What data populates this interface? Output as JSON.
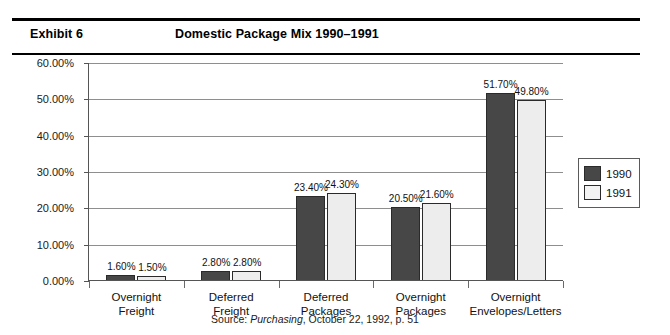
{
  "header": {
    "exhibit_label": "Exhibit 6",
    "title": "Domestic Package Mix 1990–1991"
  },
  "source": {
    "prefix": "Source: ",
    "publication": "Purchasing",
    "suffix": ", October 22, 1992, p. 51"
  },
  "legend": {
    "items": [
      {
        "label": "1990",
        "color": "#474747"
      },
      {
        "label": "1991",
        "color": "#f2f2f2"
      }
    ]
  },
  "chart_data": {
    "type": "bar",
    "title": "Domestic Package Mix 1990–1991",
    "xlabel": "",
    "ylabel": "",
    "ylim": [
      0,
      60
    ],
    "yticks": [
      0,
      10,
      20,
      30,
      40,
      50,
      60
    ],
    "ytick_labels": [
      "0.00%",
      "10.00%",
      "20.00%",
      "30.00%",
      "40.00%",
      "50.00%",
      "60.00%"
    ],
    "grid": true,
    "legend_position": "right",
    "categories": [
      "Overnight\nFreight",
      "Deferred\nFreight",
      "Deferred\nPackages",
      "Overnight\nPackages",
      "Overnight\nEnvelopes/Letters"
    ],
    "category_lines": [
      [
        "Overnight",
        "Freight"
      ],
      [
        "Deferred",
        "Freight"
      ],
      [
        "Deferred",
        "Packages"
      ],
      [
        "Overnight",
        "Packages"
      ],
      [
        "Overnight",
        "Envelopes/Letters"
      ]
    ],
    "series": [
      {
        "name": "1990",
        "color": "#474747",
        "values": [
          1.6,
          2.8,
          23.4,
          20.5,
          51.7
        ],
        "labels": [
          "1.60%",
          "2.80%",
          "23.40%",
          "20.50%",
          "51.70%"
        ]
      },
      {
        "name": "1991",
        "color": "#f2f2f2",
        "values": [
          1.5,
          2.8,
          24.3,
          21.6,
          49.8
        ],
        "labels": [
          "1.50%",
          "2.80%",
          "24.30%",
          "21.60%",
          "49.80%"
        ]
      }
    ]
  }
}
